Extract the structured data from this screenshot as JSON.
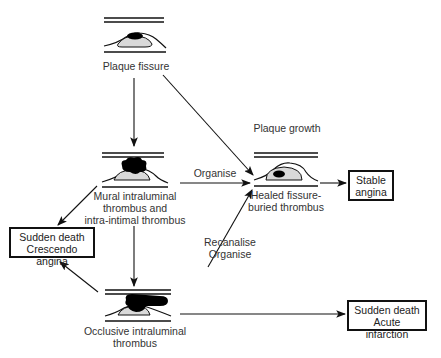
{
  "nodes": {
    "plaque_fissure": {
      "label": "Plaque fissure"
    },
    "mural_thrombus": {
      "line1": "Mural intraluminal",
      "line2": "thrombus and",
      "line3": "intra-intimal thrombus"
    },
    "occlusive_thrombus": {
      "line1": "Occlusive intraluminal",
      "line2": "thrombus"
    },
    "healed": {
      "title": "Plaque growth",
      "line1": "Healed fissure-",
      "line2": "buried thrombus"
    }
  },
  "outcomes": {
    "stable_angina": {
      "line1": "Stable",
      "line2": "angina"
    },
    "crescendo": {
      "line1": "Sudden death",
      "line2": "Crescendo angina"
    },
    "infarction": {
      "line1": "Sudden death",
      "line2": "Acute infarction"
    }
  },
  "edges": {
    "organise": "Organise",
    "recanalise_1": "Recanalise",
    "recanalise_2": "Organise"
  },
  "colors": {
    "ink": "#111111",
    "plaque_fill": "#d9d9d9",
    "thrombus": "#000000"
  }
}
